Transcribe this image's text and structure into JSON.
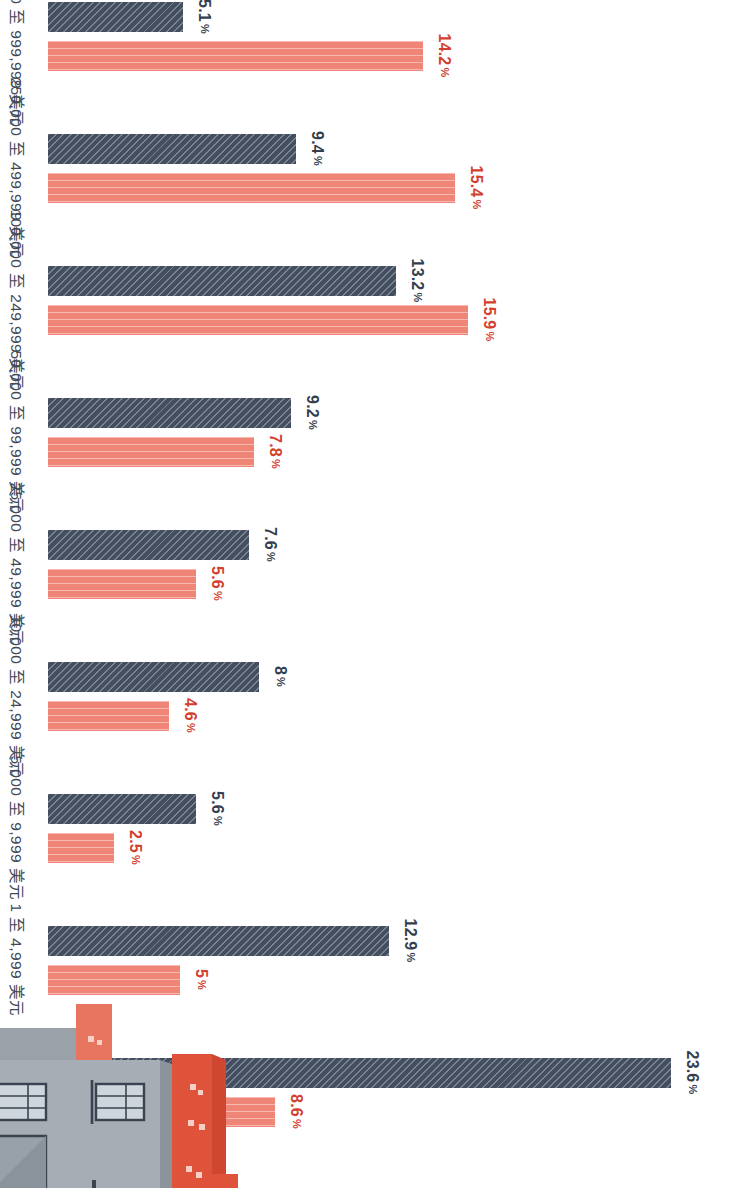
{
  "chart_data": {
    "type": "bar",
    "title": "",
    "subtitle": "",
    "xlabel": "",
    "ylabel": "",
    "grid": false,
    "orientation": "vertical-rotated-90",
    "ylim": [
      0,
      25
    ],
    "categories": [
      "0 或更少",
      "1 至 4,999 美元",
      "5,000 至 9,999 美元",
      "10,000 至 24,999 美元",
      "25,000 至 49,999 美元",
      "50,000 至 99,999 美元",
      "100,000 至 249,999 美元",
      "250,000 至 499,999 美元",
      "500,000 至 999,999 美元"
    ],
    "series": [
      {
        "name": "dark",
        "color": "#434f61",
        "pattern": "diagonal-hatch",
        "values": [
          23.6,
          12.9,
          5.6,
          8,
          7.6,
          9.2,
          13.2,
          9.4,
          5.1
        ],
        "labels": [
          "23.6 %",
          "12.9 %",
          "5.6 %",
          "8 %",
          "7.6 %",
          "9.2 %",
          "13.2 %",
          "9.4 %",
          "5.1 %"
        ]
      },
      {
        "name": "coral",
        "color": "#ef8577",
        "pattern": "vertical-stripe",
        "values": [
          8.6,
          5,
          2.5,
          4.6,
          5.6,
          7.8,
          15.9,
          15.4,
          14.2
        ],
        "labels": [
          "8.6 %",
          "5 %",
          "2.5 %",
          "4.6 %",
          "5.6 %",
          "7.8 %",
          "15.9 %",
          "15.4 %",
          "14.2 %"
        ]
      }
    ],
    "extra_bar": {
      "name": "coral-overflow",
      "color": "#ef8577",
      "value": 20.4,
      "label": "20.4 %"
    },
    "percent_suffix": "%"
  },
  "illustration": {
    "name": "building-illustration",
    "colors": {
      "facade_gray": "#a7adb5",
      "facade_gray_dark": "#949aa3",
      "facade_red": "#e0533b",
      "facade_red_light": "#e8755f",
      "window_frame": "#3a4450",
      "window_glass": "#cfd5dc"
    }
  }
}
